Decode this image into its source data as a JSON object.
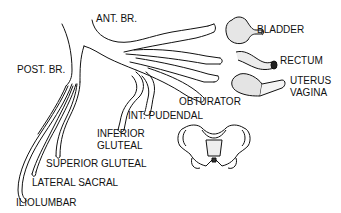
{
  "diagram": {
    "colors": {
      "ink": "#111111",
      "background": "#ffffff",
      "shading": "#cfcfcf"
    },
    "labels": {
      "ant_br": "ANT. BR.",
      "post_br": "POST. BR.",
      "bladder": "BLADDER",
      "rectum": "RECTUM",
      "uterus": "UTERUS",
      "vagina": "VAGINA",
      "obturator": "OBTURATOR",
      "int_pudendal": "INT. PUDENDAL",
      "inferior": "INFERIOR",
      "gluteal_inf": "GLUTEAL",
      "superior_gluteal": "SUPERIOR GLUTEAL",
      "lateral_sacral": "LATERAL SACRAL",
      "iliolumbar": "ILIOLUMBAR"
    },
    "icons": [
      "bladder-icon",
      "rectum-icon",
      "uterus-vagina-icon",
      "pelvis-icon"
    ]
  }
}
